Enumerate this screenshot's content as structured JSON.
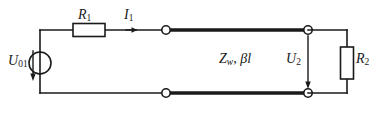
{
  "diagram": {
    "background_color": "#ffffff",
    "line_color": "#1a1a1a",
    "labels": {
      "r1": "R",
      "r1_sub": "1",
      "i1": "I",
      "i1_sub": "1",
      "u01": "U",
      "u01_sub": "01",
      "zw": "Z",
      "zw_sub": "w",
      "zw_tail": ", βl",
      "u2": "U",
      "u2_sub": "2",
      "r2": "R",
      "r2_sub": "2"
    },
    "components": {
      "source": "voltage-source-circle",
      "resistor_series": "resistor-r1",
      "transmission_line": "Z_w, βl",
      "resistor_load": "resistor-r2",
      "terminals": 4
    }
  }
}
